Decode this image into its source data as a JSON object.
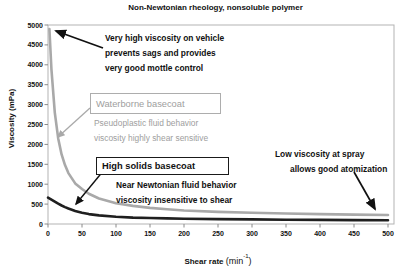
{
  "title": "Non-Newtonian rheology, nonsoluble polymer",
  "chart_data": {
    "type": "line",
    "title": "Non-Newtonian rheology, nonsoluble polymer",
    "xlabel": {
      "prefix": "Shear rate ",
      "unit_open": "(min",
      "sup": "-1",
      "unit_close": ")"
    },
    "ylabel": "Viscosity (mPa)",
    "xlim": [
      0,
      500
    ],
    "ylim": [
      0,
      5000
    ],
    "x_ticks": [
      0,
      50,
      100,
      150,
      200,
      250,
      300,
      350,
      400,
      450,
      500
    ],
    "y_ticks": [
      0,
      500,
      1000,
      1500,
      2000,
      2500,
      3000,
      3500,
      4000,
      4500,
      5000
    ],
    "grid": false,
    "legend_position": "none",
    "series": [
      {
        "name": "Waterborne basecoat",
        "color": "#a9a9a9",
        "x": [
          2,
          5,
          10,
          15,
          20,
          25,
          30,
          40,
          50,
          60,
          75,
          100,
          125,
          150,
          175,
          200,
          250,
          300,
          350,
          400,
          450,
          500
        ],
        "values": [
          4900,
          3900,
          2800,
          2150,
          1750,
          1480,
          1280,
          1020,
          880,
          760,
          640,
          520,
          455,
          405,
          370,
          340,
          305,
          282,
          265,
          250,
          237,
          225
        ]
      },
      {
        "name": "High solids basecoat",
        "color": "#1f1f1f",
        "x": [
          0,
          5,
          10,
          15,
          20,
          25,
          30,
          40,
          50,
          60,
          75,
          100,
          125,
          150,
          175,
          200,
          250,
          300,
          350,
          400,
          450,
          500
        ],
        "values": [
          660,
          610,
          560,
          510,
          465,
          425,
          390,
          330,
          285,
          250,
          215,
          182,
          162,
          150,
          141,
          133,
          122,
          115,
          108,
          102,
          97,
          92
        ]
      }
    ]
  },
  "annotations": {
    "very_high": {
      "lines": [
        "Very high viscosity on vehicle",
        "prevents sags and provides",
        "very good mottle control"
      ]
    },
    "waterborne_box": {
      "label": "Waterborne basecoat"
    },
    "pseudoplastic": {
      "lines": [
        "Pseudoplastic fluid behavior",
        "viscosity highly shear sensitive"
      ]
    },
    "high_solids_box": {
      "label": "High solids basecoat"
    },
    "near_newtonian": {
      "lines": [
        "Near Newtonian fluid behavior",
        "viscosity insensitive to shear"
      ]
    },
    "low_viscosity": {
      "lines": [
        "Low viscosity at spray",
        "allows good atomization"
      ]
    }
  },
  "colors": {
    "waterborne_curve": "#a9a9a9",
    "high_solids_curve": "#1f1f1f",
    "gray_text": "#9e9e9e",
    "black_text": "#111111",
    "plot_border": "#b3b3b3",
    "tick": "#8a8a8a"
  }
}
